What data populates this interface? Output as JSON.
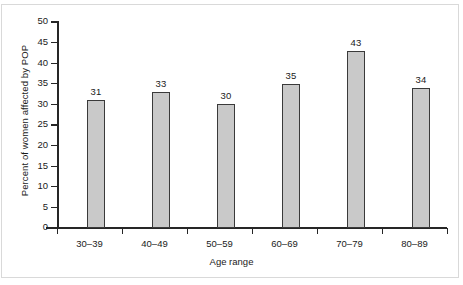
{
  "chart_data": {
    "type": "bar",
    "title": "",
    "categories": [
      "30–39",
      "40–49",
      "50–59",
      "60–69",
      "70–79",
      "80–89"
    ],
    "values": [
      31,
      33,
      30,
      35,
      43,
      34
    ],
    "data_labels": [
      "31",
      "33",
      "30",
      "35",
      "43",
      "34"
    ],
    "xlabel": "Age range",
    "ylabel": "Percent of women affected by POP",
    "ylim": [
      0,
      50
    ],
    "ytick_values": [
      0,
      5,
      10,
      15,
      20,
      25,
      30,
      35,
      40,
      45,
      50
    ],
    "ytick_labels": [
      "0",
      "5",
      "10",
      "15",
      "20",
      "25",
      "30",
      "35",
      "40",
      "45",
      "50"
    ],
    "grid": false,
    "legend": false,
    "bar_color": "#c9c9c9",
    "bar_edge_color": "#3a3a3a",
    "axis_color": "#262626"
  }
}
